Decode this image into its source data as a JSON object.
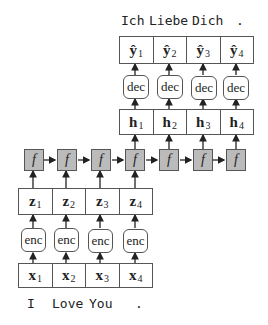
{
  "output_sentence": {
    "words": [
      "Ich",
      "Liebe",
      "Dich",
      "."
    ]
  },
  "input_sentence": {
    "words": [
      "I",
      "Love",
      "You",
      "."
    ]
  },
  "outputs": {
    "symbol": "ŷ",
    "cells": [
      {
        "sym": "ŷ",
        "sub": "1"
      },
      {
        "sym": "ŷ",
        "sub": "2"
      },
      {
        "sym": "ŷ",
        "sub": "3"
      },
      {
        "sym": "ŷ",
        "sub": "4"
      }
    ]
  },
  "decoders": {
    "labels": [
      "dec",
      "dec",
      "dec",
      "dec"
    ]
  },
  "hidden": {
    "cells": [
      {
        "sym": "h",
        "sub": "1"
      },
      {
        "sym": "h",
        "sub": "2"
      },
      {
        "sym": "h",
        "sub": "3"
      },
      {
        "sym": "h",
        "sub": "4"
      }
    ]
  },
  "recurrent": {
    "labels": [
      "f",
      "f",
      "f",
      "f",
      "f",
      "f",
      "f"
    ]
  },
  "latents": {
    "cells": [
      {
        "sym": "z",
        "sub": "1"
      },
      {
        "sym": "z",
        "sub": "2"
      },
      {
        "sym": "z",
        "sub": "3"
      },
      {
        "sym": "z",
        "sub": "4"
      }
    ]
  },
  "encoders": {
    "labels": [
      "enc",
      "enc",
      "enc",
      "enc"
    ]
  },
  "inputs": {
    "cells": [
      {
        "sym": "x",
        "sub": "1"
      },
      {
        "sym": "x",
        "sub": "2"
      },
      {
        "sym": "x",
        "sub": "3"
      },
      {
        "sym": "x",
        "sub": "4"
      }
    ]
  }
}
